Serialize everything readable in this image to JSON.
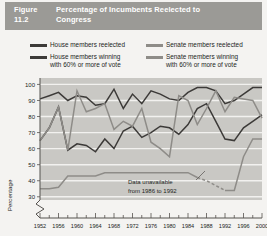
{
  "figure": {
    "number": "Figure 11.2",
    "title": "Percentage of Incumbents Reelected to Congress"
  },
  "legend": {
    "house_reelected": {
      "label": "House members reelected",
      "color": "#3c3a38"
    },
    "house_winning": {
      "label": "House members winning\nwith 60% or more of vote",
      "color": "#3c3a38"
    },
    "senate_reelected": {
      "label": "Senate members reelected",
      "color": "#8e8c88"
    },
    "senate_winning": {
      "label": "Senate members winning\nwith 60% or more of vote",
      "color": "#8e8c88"
    }
  },
  "annotation": {
    "line1": "Data unavailable",
    "line2": "from 1986 to 1992"
  },
  "colors": {
    "title_bar": "#9b9a96",
    "plot_background": "#c9c8c4",
    "gridline": "#f2f1ef",
    "axis": "#55524f",
    "text": "#231f1c",
    "page": "#f4f3f1"
  },
  "chart_data": {
    "type": "line",
    "title": "Percentage of Incumbents Reelected to Congress",
    "xlabel": "",
    "ylabel": "Percentage",
    "xlim": [
      1952,
      2000
    ],
    "ylim": [
      28,
      104
    ],
    "yticks": [
      30,
      40,
      50,
      60,
      70,
      80,
      90,
      100
    ],
    "axis_break": true,
    "grid": "horizontal",
    "legend_position": "above-plot",
    "x": [
      1952,
      1954,
      1956,
      1958,
      1960,
      1962,
      1964,
      1966,
      1968,
      1970,
      1972,
      1974,
      1976,
      1978,
      1980,
      1982,
      1984,
      1986,
      1988,
      1990,
      1992,
      1994,
      1996,
      1998,
      2000
    ],
    "xticks": [
      1952,
      1956,
      1960,
      1964,
      1968,
      1972,
      1976,
      1980,
      1984,
      1988,
      1992,
      1996,
      2000
    ],
    "series": [
      {
        "name": "House members reelected",
        "color": "#3c3a38",
        "style": "solid",
        "values": [
          91,
          93,
          95,
          90,
          93,
          92,
          87,
          88,
          97,
          85,
          94,
          88,
          96,
          94,
          91,
          90,
          95,
          98,
          98,
          96,
          88,
          90,
          94,
          98,
          98
        ]
      },
      {
        "name": "House members winning with 60% or more of vote",
        "color": "#3c3a38",
        "style": "solid",
        "values": [
          65,
          73,
          86,
          59,
          63,
          62,
          58,
          66,
          60,
          71,
          74,
          67,
          70,
          74,
          73,
          69,
          75,
          85,
          88,
          77,
          66,
          65,
          73,
          77,
          81
        ]
      },
      {
        "name": "Senate members reelected",
        "color": "#8e8c88",
        "style": "solid",
        "values": [
          65,
          73,
          86,
          59,
          96,
          83,
          85,
          88,
          72,
          77,
          74,
          85,
          64,
          60,
          55,
          93,
          90,
          75,
          85,
          96,
          83,
          92,
          91,
          90,
          79
        ]
      },
      {
        "name": "Senate members winning with 60% or more of vote",
        "color": "#8e8c88",
        "style": "solid-with-dashed-gap",
        "gap_start": 1986,
        "gap_end": 1992,
        "values": [
          35,
          35,
          36,
          43,
          43,
          43,
          43,
          45,
          45,
          45,
          45,
          45,
          45,
          45,
          45,
          45,
          45,
          42,
          40,
          37,
          34,
          34,
          55,
          66,
          66
        ]
      }
    ]
  }
}
